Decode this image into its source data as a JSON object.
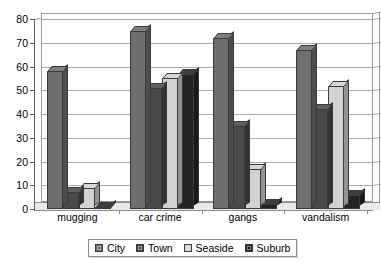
{
  "chart_data": {
    "type": "bar",
    "title": "",
    "subtitle": "",
    "xlabel": "",
    "ylabel": "",
    "categories": [
      "mugging",
      "car crime",
      "gangs",
      "vandalism"
    ],
    "series": [
      {
        "name": "City",
        "color": "#6e6e6e",
        "values": [
          58,
          75,
          72,
          67
        ]
      },
      {
        "name": "Town",
        "color": "#4a4a4a",
        "values": [
          7,
          51,
          35,
          42
        ]
      },
      {
        "name": "Seaside",
        "color": "#d2d2d2",
        "values": [
          9,
          55,
          17,
          52
        ]
      },
      {
        "name": "Suburb",
        "color": "#232323",
        "values": [
          1,
          57,
          2,
          6
        ]
      }
    ],
    "ylim": [
      0,
      80
    ],
    "ytick_step": 10,
    "yticks": [
      0,
      10,
      20,
      30,
      40,
      50,
      60,
      70,
      80
    ],
    "ytick_labels": [
      "0",
      "10",
      "20",
      "30",
      "40",
      "50",
      "60",
      "70",
      "80"
    ],
    "grid": true,
    "grid_axis": "y",
    "legend_position": "bottom",
    "legend_entries": [
      "City",
      "Town",
      "Seaside",
      "Suburb"
    ],
    "style": "3d-clustered-column",
    "annotations": []
  }
}
